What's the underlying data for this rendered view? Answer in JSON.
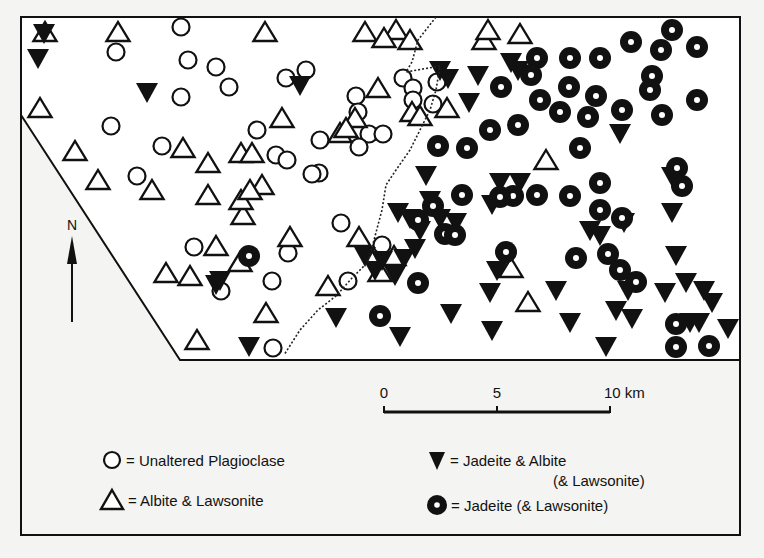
{
  "figure": {
    "background": "#f4f4f2",
    "ink": "#111111",
    "frame": {
      "left": 21,
      "top": 17,
      "right": 740,
      "bottom": 535
    },
    "map_boundary": [
      [
        21,
        17
      ],
      [
        740,
        17
      ],
      [
        740,
        360
      ],
      [
        180,
        360
      ],
      [
        21,
        115
      ]
    ],
    "isograd_dotted_line": [
      [
        436,
        17
      ],
      [
        418,
        40
      ],
      [
        412,
        62
      ],
      [
        406,
        72
      ],
      [
        440,
        66
      ],
      [
        436,
        90
      ],
      [
        430,
        110
      ],
      [
        420,
        130
      ],
      [
        410,
        150
      ],
      [
        396,
        170
      ],
      [
        386,
        185
      ],
      [
        382,
        210
      ],
      [
        374,
        240
      ],
      [
        368,
        262
      ],
      [
        352,
        278
      ],
      [
        336,
        296
      ],
      [
        318,
        310
      ],
      [
        300,
        330
      ],
      [
        284,
        355
      ]
    ]
  },
  "north_arrow": {
    "label": "N",
    "x": 72,
    "label_y": 230,
    "arrow_top": 240,
    "arrow_bottom": 322
  },
  "scale_bar": {
    "ticks": [
      {
        "label": "0",
        "x": 384
      },
      {
        "label": "5",
        "x": 497
      },
      {
        "label": "10 km",
        "x": 610
      }
    ],
    "y": 411,
    "label_y": 398
  },
  "legend": {
    "items": [
      {
        "symbol": "open-circle",
        "label": "= Unaltered Plagioclase",
        "x": 112,
        "y": 460
      },
      {
        "symbol": "open-triangle",
        "label": "= Albite & Lawsonite",
        "x": 112,
        "y": 500
      },
      {
        "symbol": "filled-inverted-triangle",
        "label": "= Jadeite & Albite",
        "label2": "(& Lawsonite)",
        "x": 437,
        "y": 460
      },
      {
        "symbol": "bullseye",
        "label": "= Jadeite (& Lawsonite)",
        "x": 437,
        "y": 505
      }
    ]
  },
  "map_symbols": {
    "open_circles": [
      [
        181,
        27
      ],
      [
        116,
        52
      ],
      [
        188,
        60
      ],
      [
        216,
        67
      ],
      [
        181,
        97
      ],
      [
        229,
        87
      ],
      [
        286,
        78
      ],
      [
        306,
        70
      ],
      [
        111,
        126
      ],
      [
        162,
        146
      ],
      [
        137,
        176
      ],
      [
        257,
        130
      ],
      [
        276,
        155
      ],
      [
        287,
        160
      ],
      [
        320,
        140
      ],
      [
        319,
        173
      ],
      [
        356,
        96
      ],
      [
        358,
        112
      ],
      [
        369,
        134
      ],
      [
        383,
        134
      ],
      [
        359,
        147
      ],
      [
        403,
        78
      ],
      [
        413,
        88
      ],
      [
        413,
        100
      ],
      [
        433,
        104
      ],
      [
        437,
        82
      ],
      [
        194,
        247
      ],
      [
        221,
        291
      ],
      [
        288,
        253
      ],
      [
        272,
        281
      ],
      [
        341,
        223
      ],
      [
        382,
        245
      ],
      [
        348,
        281
      ],
      [
        273,
        348
      ],
      [
        312,
        174
      ]
    ],
    "open_triangles": [
      [
        45,
        32
      ],
      [
        118,
        32
      ],
      [
        265,
        32
      ],
      [
        365,
        32
      ],
      [
        396,
        30
      ],
      [
        410,
        40
      ],
      [
        384,
        38
      ],
      [
        484,
        40
      ],
      [
        488,
        30
      ],
      [
        520,
        34
      ],
      [
        40,
        108
      ],
      [
        282,
        118
      ],
      [
        378,
        88
      ],
      [
        75,
        151
      ],
      [
        183,
        148
      ],
      [
        208,
        163
      ],
      [
        241,
        153
      ],
      [
        252,
        153
      ],
      [
        355,
        118
      ],
      [
        340,
        133
      ],
      [
        346,
        128
      ],
      [
        412,
        112
      ],
      [
        420,
        116
      ],
      [
        447,
        108
      ],
      [
        98,
        180
      ],
      [
        152,
        190
      ],
      [
        208,
        195
      ],
      [
        262,
        185
      ],
      [
        243,
        215
      ],
      [
        241,
        200
      ],
      [
        250,
        190
      ],
      [
        290,
        237
      ],
      [
        216,
        246
      ],
      [
        359,
        237
      ],
      [
        166,
        273
      ],
      [
        190,
        276
      ],
      [
        240,
        262
      ],
      [
        511,
        268
      ],
      [
        328,
        286
      ],
      [
        266,
        313
      ],
      [
        528,
        302
      ],
      [
        197,
        340
      ],
      [
        546,
        160
      ],
      [
        380,
        272
      ],
      [
        394,
        256
      ]
    ],
    "filled_triangles": [
      [
        44,
        33
      ],
      [
        38,
        58
      ],
      [
        147,
        92
      ],
      [
        300,
        85
      ],
      [
        440,
        70
      ],
      [
        448,
        78
      ],
      [
        478,
        75
      ],
      [
        511,
        62
      ],
      [
        518,
        70
      ],
      [
        469,
        102
      ],
      [
        426,
        175
      ],
      [
        620,
        133
      ],
      [
        672,
        176
      ],
      [
        398,
        212
      ],
      [
        410,
        218
      ],
      [
        420,
        230
      ],
      [
        440,
        218
      ],
      [
        456,
        222
      ],
      [
        415,
        248
      ],
      [
        382,
        260
      ],
      [
        365,
        256
      ],
      [
        375,
        270
      ],
      [
        404,
        258
      ],
      [
        395,
        275
      ],
      [
        492,
        204
      ],
      [
        500,
        182
      ],
      [
        520,
        182
      ],
      [
        590,
        230
      ],
      [
        600,
        235
      ],
      [
        624,
        222
      ],
      [
        672,
        212
      ],
      [
        676,
        255
      ],
      [
        490,
        292
      ],
      [
        497,
        270
      ],
      [
        556,
        290
      ],
      [
        616,
        310
      ],
      [
        628,
        290
      ],
      [
        665,
        292
      ],
      [
        686,
        282
      ],
      [
        704,
        290
      ],
      [
        712,
        302
      ],
      [
        728,
        328
      ],
      [
        216,
        284
      ],
      [
        249,
        346
      ],
      [
        336,
        317
      ],
      [
        400,
        336
      ],
      [
        451,
        313
      ],
      [
        492,
        330
      ],
      [
        570,
        322
      ],
      [
        606,
        346
      ],
      [
        632,
        318
      ],
      [
        690,
        322
      ],
      [
        699,
        322
      ],
      [
        220,
        280
      ],
      [
        430,
        200
      ]
    ],
    "bullseyes": [
      [
        537,
        58
      ],
      [
        570,
        58
      ],
      [
        600,
        58
      ],
      [
        631,
        42
      ],
      [
        672,
        30
      ],
      [
        661,
        50
      ],
      [
        697,
        47
      ],
      [
        652,
        76
      ],
      [
        650,
        90
      ],
      [
        662,
        115
      ],
      [
        697,
        100
      ],
      [
        501,
        87
      ],
      [
        531,
        75
      ],
      [
        569,
        87
      ],
      [
        596,
        96
      ],
      [
        540,
        100
      ],
      [
        560,
        112
      ],
      [
        588,
        117
      ],
      [
        622,
        110
      ],
      [
        518,
        125
      ],
      [
        490,
        130
      ],
      [
        467,
        148
      ],
      [
        438,
        146
      ],
      [
        580,
        148
      ],
      [
        677,
        168
      ],
      [
        682,
        186
      ],
      [
        600,
        183
      ],
      [
        537,
        195
      ],
      [
        570,
        196
      ],
      [
        513,
        196
      ],
      [
        462,
        195
      ],
      [
        433,
        206
      ],
      [
        418,
        220
      ],
      [
        445,
        234
      ],
      [
        455,
        235
      ],
      [
        622,
        218
      ],
      [
        600,
        210
      ],
      [
        608,
        254
      ],
      [
        576,
        258
      ],
      [
        620,
        270
      ],
      [
        636,
        282
      ],
      [
        506,
        252
      ],
      [
        249,
        256
      ],
      [
        380,
        316
      ],
      [
        418,
        283
      ],
      [
        676,
        324
      ],
      [
        676,
        347
      ],
      [
        709,
        346
      ],
      [
        500,
        197
      ]
    ]
  }
}
